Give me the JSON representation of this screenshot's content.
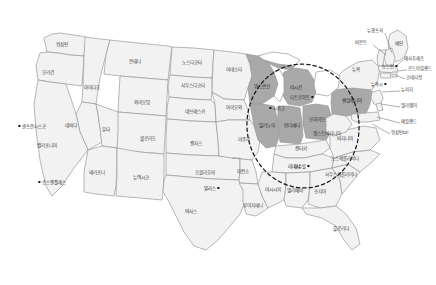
{
  "map": {
    "title": "미국 주(州) 지도",
    "region_highlight_name": "중서부 하이라이트 지역",
    "colors": {
      "state_fill": "#f2f2f2",
      "highlight_fill": "#a9a9a9",
      "border": "#9a9a9a",
      "ellipse": "#1b1b1b",
      "background": "#ffffff",
      "label_text": "#3a3a3a",
      "city_marker": "#111111"
    },
    "states": [
      {
        "name": "워싱턴",
        "x": 62,
        "y": 45,
        "highlighted": false
      },
      {
        "name": "오리건",
        "x": 48,
        "y": 73,
        "highlighted": false
      },
      {
        "name": "아이다호",
        "x": 92,
        "y": 88,
        "highlighted": false
      },
      {
        "name": "몬태나",
        "x": 135,
        "y": 62,
        "highlighted": false
      },
      {
        "name": "와이오밍",
        "x": 142,
        "y": 103,
        "highlighted": false
      },
      {
        "name": "노스다코타",
        "x": 192,
        "y": 63,
        "highlighted": false
      },
      {
        "name": "사우스다코타",
        "x": 193,
        "y": 86,
        "highlighted": false
      },
      {
        "name": "네브래스카",
        "x": 195,
        "y": 112,
        "highlighted": false
      },
      {
        "name": "네바다",
        "x": 71,
        "y": 126,
        "highlighted": false
      },
      {
        "name": "유타",
        "x": 106,
        "y": 130,
        "highlighted": false
      },
      {
        "name": "콜로라도",
        "x": 148,
        "y": 139,
        "highlighted": false
      },
      {
        "name": "캔자스",
        "x": 196,
        "y": 144,
        "highlighted": false
      },
      {
        "name": "캘리포니아",
        "x": 47,
        "y": 146,
        "highlighted": false
      },
      {
        "name": "애리조나",
        "x": 97,
        "y": 173,
        "highlighted": false
      },
      {
        "name": "뉴멕시코",
        "x": 141,
        "y": 178,
        "highlighted": false
      },
      {
        "name": "오클라호마",
        "x": 205,
        "y": 173,
        "highlighted": false
      },
      {
        "name": "텍사스",
        "x": 191,
        "y": 212,
        "highlighted": false
      },
      {
        "name": "미네소타",
        "x": 234,
        "y": 70,
        "highlighted": false
      },
      {
        "name": "아이오와",
        "x": 234,
        "y": 108,
        "highlighted": false
      },
      {
        "name": "미주리",
        "x": 244,
        "y": 140,
        "highlighted": false
      },
      {
        "name": "아칸소",
        "x": 243,
        "y": 172,
        "highlighted": false
      },
      {
        "name": "루이지애나",
        "x": 253,
        "y": 206,
        "highlighted": false
      },
      {
        "name": "위생콘신",
        "x": 262,
        "y": 87,
        "highlighted": true,
        "display": "위스콘신"
      },
      {
        "name": "미시간",
        "x": 296,
        "y": 88,
        "highlighted": true
      },
      {
        "name": "일리노이",
        "x": 267,
        "y": 126,
        "highlighted": true
      },
      {
        "name": "인디애나",
        "x": 292,
        "y": 126,
        "highlighted": true
      },
      {
        "name": "오하이오",
        "x": 317,
        "y": 120,
        "highlighted": true
      },
      {
        "name": "펜실베니아",
        "x": 352,
        "y": 101,
        "highlighted": true
      },
      {
        "name": "켄터키",
        "x": 301,
        "y": 149,
        "highlighted": false
      },
      {
        "name": "테네시",
        "x": 294,
        "y": 167,
        "highlighted": false
      },
      {
        "name": "미시시피",
        "x": 273,
        "y": 190,
        "highlighted": false
      },
      {
        "name": "앨라배마",
        "x": 295,
        "y": 191,
        "highlighted": false
      },
      {
        "name": "조지아",
        "x": 320,
        "y": 192,
        "highlighted": false
      },
      {
        "name": "플로리다",
        "x": 341,
        "y": 229,
        "highlighted": false
      },
      {
        "name": "사우스캐롤라이나",
        "x": 341,
        "y": 175,
        "highlighted": false
      },
      {
        "name": "노스캐롤라이나",
        "x": 345,
        "y": 159,
        "highlighted": false
      },
      {
        "name": "버지니아",
        "x": 345,
        "y": 139,
        "highlighted": false
      },
      {
        "name": "웨스트버지니아",
        "x": 327,
        "y": 134,
        "highlighted": false
      },
      {
        "name": "뉴욕",
        "x": 356,
        "y": 70,
        "highlighted": false
      },
      {
        "name": "메인",
        "x": 399,
        "y": 44,
        "highlighted": false
      }
    ],
    "callouts": [
      {
        "name": "뉴햄프셔",
        "x": 367,
        "y": 31,
        "anchor": "left",
        "lx1": 385,
        "ly1": 33,
        "lx2": 392,
        "ly2": 53
      },
      {
        "name": "버몬트",
        "x": 355,
        "y": 43,
        "anchor": "left",
        "lx1": 373,
        "ly1": 45,
        "lx2": 386,
        "ly2": 55
      },
      {
        "name": "매사추세츠",
        "x": 404,
        "y": 59,
        "anchor": "left",
        "lx1": 403,
        "ly1": 60,
        "lx2": 396,
        "ly2": 66
      },
      {
        "name": "로드아일랜드",
        "x": 408,
        "y": 69,
        "anchor": "left",
        "lx1": 407,
        "ly1": 70,
        "lx2": 397,
        "ly2": 71
      },
      {
        "name": "코네티컷",
        "x": 406,
        "y": 78,
        "anchor": "left",
        "lx1": 405,
        "ly1": 79,
        "lx2": 393,
        "ly2": 74
      },
      {
        "name": "뉴저지",
        "x": 401,
        "y": 90,
        "anchor": "left",
        "lx1": 400,
        "ly1": 91,
        "lx2": 382,
        "ly2": 92
      },
      {
        "name": "델라웨어",
        "x": 401,
        "y": 106,
        "anchor": "left",
        "lx1": 400,
        "ly1": 107,
        "lx2": 381,
        "ly2": 104
      },
      {
        "name": "메릴랜드",
        "x": 401,
        "y": 122,
        "anchor": "left",
        "lx1": 400,
        "ly1": 123,
        "lx2": 377,
        "ly2": 117
      },
      {
        "name": "워싱턴DC",
        "x": 391,
        "y": 133,
        "anchor": "left",
        "lx1": 390,
        "ly1": 134,
        "lx2": 372,
        "ly2": 124
      }
    ],
    "cities": [
      {
        "name": "샌프란시스코",
        "x": 32,
        "y": 126,
        "side": "right"
      },
      {
        "name": "로스앤젤레스",
        "x": 52,
        "y": 182,
        "side": "right"
      },
      {
        "name": "댈러스",
        "x": 212,
        "y": 188,
        "side": "left"
      },
      {
        "name": "시카고",
        "x": 277,
        "y": 108,
        "side": "right"
      },
      {
        "name": "디트로이트",
        "x": 302,
        "y": 97,
        "side": "left"
      },
      {
        "name": "내슈빌",
        "x": 302,
        "y": 166,
        "side": "left"
      },
      {
        "name": "뉴욕시",
        "x": 379,
        "y": 84,
        "side": "left"
      },
      {
        "name": "보스턴",
        "x": 390,
        "y": 66,
        "side": "left"
      }
    ],
    "ellipse": {
      "cx": 303,
      "cy": 126,
      "rx": 56,
      "ry": 62,
      "rotate": -6
    }
  }
}
